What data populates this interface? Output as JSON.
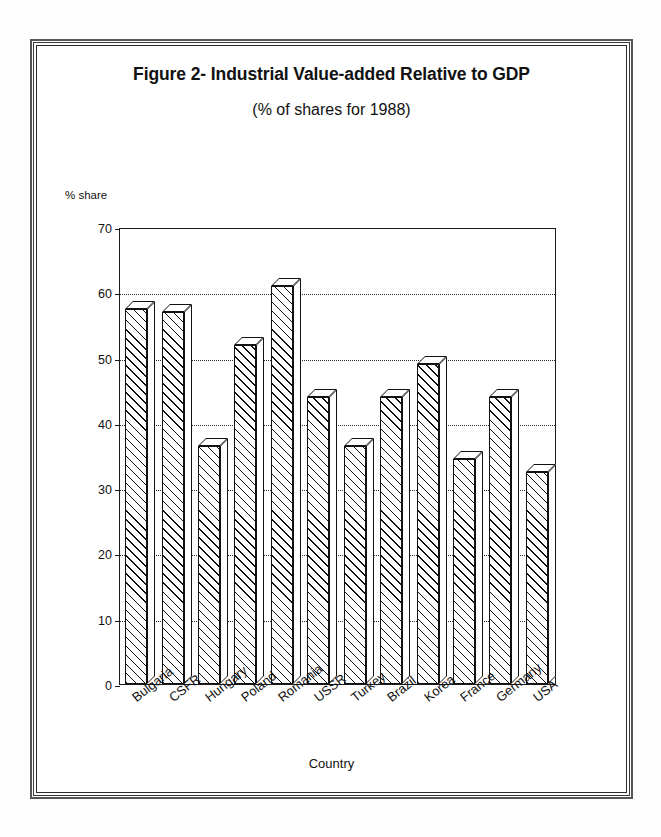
{
  "figure": {
    "title": "Figure 2- Industrial Value-added Relative to GDP",
    "subtitle": "(% of shares for 1988)"
  },
  "chart_data": {
    "type": "bar",
    "title": "Figure 2- Industrial Value-added Relative to GDP",
    "subtitle": "(% of shares for 1988)",
    "xlabel": "Country",
    "ylabel": "% share",
    "ylim": [
      0,
      70
    ],
    "yticks": [
      0,
      10,
      20,
      30,
      40,
      50,
      60,
      70
    ],
    "grid": true,
    "legend": null,
    "categories": [
      "Bulgaria",
      "CSFR",
      "Hungary",
      "Poland",
      "Romania",
      "USSR",
      "Turkey",
      "Brazil",
      "Korea",
      "France",
      "Germany",
      "USA"
    ],
    "values": [
      57.5,
      57,
      36.5,
      52,
      61,
      44,
      36.5,
      44,
      49,
      34.5,
      44,
      32.5
    ]
  },
  "style": {
    "ink": "#111111",
    "paper": "#ffffff"
  }
}
